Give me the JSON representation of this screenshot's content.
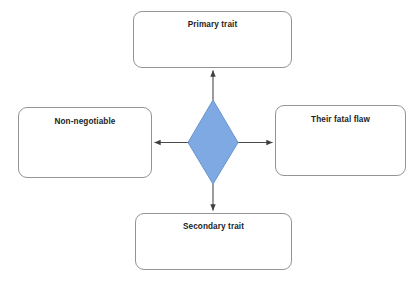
{
  "diagram": {
    "type": "hub-and-spoke",
    "background_color": "#ffffff",
    "center": {
      "shape": "diamond",
      "label": "",
      "fill_color": "#7FA9E3",
      "stroke_color": "#6A93CE",
      "cx": 213,
      "cy": 142,
      "half_width": 24,
      "half_height": 41
    },
    "nodes": [
      {
        "id": "primary",
        "label": "Primary trait",
        "position": "top",
        "shape": "rounded-rectangle",
        "fill_color": "#ffffff",
        "stroke_color": "#949494"
      },
      {
        "id": "non-negotiable",
        "label": "Non-negotiable",
        "position": "left",
        "shape": "rounded-rectangle",
        "fill_color": "#ffffff",
        "stroke_color": "#949494"
      },
      {
        "id": "fatal-flaw",
        "label": "Their fatal flaw",
        "position": "right",
        "shape": "rounded-rectangle",
        "fill_color": "#ffffff",
        "stroke_color": "#949494"
      },
      {
        "id": "secondary",
        "label": "Secondary trait",
        "position": "bottom",
        "shape": "rounded-rectangle",
        "fill_color": "#ffffff",
        "stroke_color": "#949494"
      }
    ],
    "connectors": [
      {
        "id": "center-to-primary",
        "from": "center",
        "to": "primary",
        "direction": "up",
        "arrowhead": "end",
        "color": "#4a4a4a"
      },
      {
        "id": "center-to-left",
        "from": "center",
        "to": "non-negotiable",
        "direction": "left",
        "arrowhead": "end",
        "color": "#4a4a4a"
      },
      {
        "id": "center-to-right",
        "from": "center",
        "to": "fatal-flaw",
        "direction": "right",
        "arrowhead": "end",
        "color": "#4a4a4a"
      },
      {
        "id": "center-to-secondary",
        "from": "center",
        "to": "secondary",
        "direction": "down",
        "arrowhead": "end",
        "color": "#4a4a4a"
      }
    ]
  }
}
